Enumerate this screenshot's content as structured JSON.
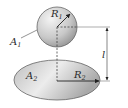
{
  "diagram": {
    "sphere": {
      "label": "A",
      "label_sub": "1",
      "radius_label": "R",
      "radius_sub": "1"
    },
    "disk": {
      "label": "A",
      "label_sub": "2",
      "radius_label": "R",
      "radius_sub": "2"
    },
    "distance_label": "l",
    "colors": {
      "fill_light": "#f2f2f2",
      "fill_dark": "#9a9a9a",
      "stroke": "#555555",
      "line": "#444444"
    }
  }
}
